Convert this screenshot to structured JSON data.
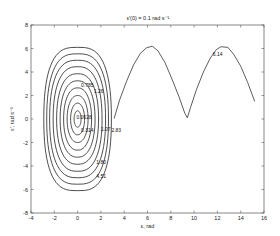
{
  "chart_data": {
    "type": "line",
    "title": "ε′(0) = 0.1 rad s⁻¹",
    "xlabel": "ε, rad",
    "ylabel": "ε′, rad s⁻¹",
    "xlim": [
      -4,
      16
    ],
    "ylim": [
      -8,
      8
    ],
    "xticks": [
      -4,
      -2,
      0,
      2,
      4,
      6,
      8,
      10,
      12,
      14,
      16
    ],
    "yticks": [
      -8,
      -6,
      -4,
      -2,
      0,
      2,
      4,
      6,
      8
    ],
    "grid": false,
    "legend": null,
    "closed_orbits": {
      "description": "Nested closed phase-plane orbits centered at (0,0)",
      "center": [
        0,
        0
      ],
      "amplitudes": [
        {
          "x": 0.3,
          "y": 0.7
        },
        {
          "x": 0.6,
          "y": 1.35
        },
        {
          "x": 0.9,
          "y": 2.0
        },
        {
          "x": 1.2,
          "y": 2.65
        },
        {
          "x": 1.5,
          "y": 3.25
        },
        {
          "x": 1.8,
          "y": 3.85
        },
        {
          "x": 2.1,
          "y": 4.45
        },
        {
          "x": 2.4,
          "y": 5.0
        },
        {
          "x": 2.65,
          "y": 5.55
        },
        {
          "x": 2.9,
          "y": 6.1
        }
      ]
    },
    "rotating_orbit": {
      "description": "Open (rotating) trajectory",
      "x": [
        3.14,
        3.6,
        4.2,
        4.8,
        5.4,
        5.9,
        6.4,
        6.9,
        7.5,
        8.1,
        8.7,
        9.2,
        9.42,
        9.7,
        10.2,
        10.8,
        11.4,
        11.9,
        12.3,
        12.9,
        13.4,
        14.0,
        14.6,
        15.2
      ],
      "y": [
        0.05,
        1.6,
        3.2,
        4.6,
        5.6,
        6.05,
        6.2,
        5.8,
        4.8,
        3.4,
        1.9,
        0.5,
        0.1,
        1.0,
        2.5,
        4.0,
        5.2,
        5.9,
        6.15,
        6.1,
        5.5,
        4.5,
        3.1,
        1.5
      ]
    },
    "contour_labels": [
      {
        "text": "0.0628",
        "x": -0.1,
        "y": 0.0
      },
      {
        "text": "0.314",
        "x": 0.3,
        "y": -1.1
      },
      {
        "text": "1.07",
        "x": 2.0,
        "y": -1.0
      },
      {
        "text": "2.83",
        "x": 2.9,
        "y": -1.1
      },
      {
        "text": "0.785",
        "x": 0.3,
        "y": 2.7
      },
      {
        "text": "1.26",
        "x": 1.4,
        "y": 2.2
      },
      {
        "text": "1.80",
        "x": 1.6,
        "y": -3.8
      },
      {
        "text": "4.51",
        "x": 1.6,
        "y": -5.0
      },
      {
        "text": "6.14",
        "x": 11.6,
        "y": 5.4
      }
    ]
  }
}
